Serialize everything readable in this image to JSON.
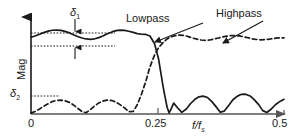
{
  "figure": {
    "kind": "filter-magnitude-response-diagram",
    "background_color": "#ffffff",
    "line_color": "#1a1a1a"
  },
  "axes": {
    "y_axis_label": "Mag",
    "x_axis_label_main": "f/f",
    "x_axis_label_sub": "s",
    "x_ticks": [
      "0",
      "0.25",
      "0.5"
    ],
    "x_tick_values": [
      0,
      0.25,
      0.5
    ],
    "y_ticks": [],
    "grid": false,
    "y_arrow": true,
    "x_arrow": true
  },
  "annotations": {
    "delta1_symbol": "δ",
    "delta1_sub": "1",
    "delta2_symbol": "δ",
    "delta2_sub": "2",
    "lowpass_label": "Lowpass",
    "highpass_label": "Highpass",
    "ripple_upper_value": 1.0,
    "ripple_lower_value": 0.86,
    "stopband_level_value": 0.165
  },
  "chart_data": {
    "type": "line",
    "title": "",
    "subtitle": "",
    "xlabel": "f/fs",
    "ylabel": "Mag",
    "xlim": [
      0,
      0.5
    ],
    "ylim": [
      0,
      1.12
    ],
    "grid": false,
    "legend": "inline-callout",
    "reference_lines": [
      {
        "name": "passband-upper-ripple",
        "y": 1.0,
        "style": "dotted",
        "x_from": 0.0,
        "x_to": 0.33
      },
      {
        "name": "passband-lower-ripple",
        "y": 0.86,
        "style": "dotted",
        "x_from": 0.0,
        "x_to": 0.33
      },
      {
        "name": "stopband-ripple",
        "y": 0.165,
        "style": "dotted",
        "x_from": 0.0,
        "x_to": 0.115
      }
    ],
    "series": [
      {
        "name": "Lowpass",
        "style": "solid",
        "x": [
          0.0,
          0.008,
          0.017,
          0.025,
          0.034,
          0.042,
          0.05,
          0.059,
          0.067,
          0.076,
          0.084,
          0.092,
          0.101,
          0.109,
          0.118,
          0.126,
          0.134,
          0.143,
          0.151,
          0.16,
          0.168,
          0.176,
          0.185,
          0.193,
          0.202,
          0.21,
          0.218,
          0.227,
          0.235,
          0.244,
          0.252,
          0.261,
          0.265,
          0.269,
          0.273,
          0.277,
          0.282,
          0.29,
          0.298,
          0.307,
          0.315,
          0.324,
          0.332,
          0.34,
          0.349,
          0.357,
          0.366,
          0.374,
          0.382,
          0.391,
          0.399,
          0.408,
          0.416,
          0.424,
          0.433,
          0.441,
          0.45,
          0.458,
          0.466,
          0.475,
          0.483,
          0.492,
          0.5
        ],
        "y": [
          0.915,
          0.93,
          0.95,
          0.97,
          0.988,
          0.998,
          1.0,
          0.996,
          0.984,
          0.966,
          0.944,
          0.924,
          0.906,
          0.894,
          0.89,
          0.896,
          0.91,
          0.932,
          0.956,
          0.978,
          0.994,
          1.0,
          0.996,
          0.986,
          0.972,
          0.958,
          0.95,
          0.948,
          0.93,
          0.84,
          0.66,
          0.33,
          0.2,
          0.08,
          0.012,
          0.06,
          0.13,
          0.072,
          0.02,
          0.06,
          0.122,
          0.175,
          0.205,
          0.213,
          0.196,
          0.15,
          0.085,
          0.022,
          0.035,
          0.105,
          0.17,
          0.213,
          0.235,
          0.236,
          0.215,
          0.172,
          0.112,
          0.04,
          0.018,
          0.06,
          0.11,
          0.15,
          0.175
        ]
      },
      {
        "name": "Highpass",
        "style": "dashed",
        "x": [
          0.0,
          0.008,
          0.017,
          0.025,
          0.034,
          0.042,
          0.05,
          0.059,
          0.067,
          0.076,
          0.084,
          0.092,
          0.101,
          0.109,
          0.118,
          0.126,
          0.134,
          0.143,
          0.151,
          0.16,
          0.168,
          0.176,
          0.185,
          0.193,
          0.202,
          0.21,
          0.218,
          0.227,
          0.235,
          0.244,
          0.252,
          0.261,
          0.269,
          0.277,
          0.286,
          0.294,
          0.303,
          0.311,
          0.319,
          0.328,
          0.336,
          0.345,
          0.353,
          0.361,
          0.37,
          0.378,
          0.387,
          0.395,
          0.403,
          0.412,
          0.42,
          0.429,
          0.437,
          0.445,
          0.454,
          0.462,
          0.471,
          0.479,
          0.487,
          0.496,
          0.5
        ],
        "y": [
          0.01,
          0.03,
          0.06,
          0.092,
          0.122,
          0.148,
          0.162,
          0.166,
          0.158,
          0.138,
          0.108,
          0.07,
          0.028,
          0.015,
          0.055,
          0.098,
          0.132,
          0.156,
          0.166,
          0.16,
          0.142,
          0.112,
          0.072,
          0.028,
          0.03,
          0.11,
          0.23,
          0.39,
          0.56,
          0.7,
          0.79,
          0.85,
          0.895,
          0.92,
          0.935,
          0.94,
          0.935,
          0.922,
          0.906,
          0.892,
          0.882,
          0.878,
          0.882,
          0.892,
          0.905,
          0.918,
          0.928,
          0.934,
          0.935,
          0.93,
          0.92,
          0.908,
          0.896,
          0.888,
          0.884,
          0.886,
          0.892,
          0.9,
          0.906,
          0.908,
          0.906
        ]
      }
    ],
    "callouts": [
      {
        "label": "Lowpass",
        "from_x": 0.345,
        "from_y": 1.06,
        "to_x": 0.243,
        "to_y": 0.905
      },
      {
        "label": "Highpass",
        "from_x": 0.455,
        "from_y": 1.08,
        "to_x": 0.372,
        "to_y": 0.905
      }
    ]
  }
}
